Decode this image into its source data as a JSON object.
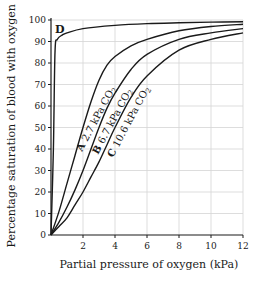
{
  "chart_data": {
    "type": "line",
    "title": "",
    "xlabel": "Partial pressure of oxygen (kPa)",
    "ylabel": "Percentage saturation of blood with oxygen",
    "xlim": [
      0,
      12
    ],
    "ylim": [
      0,
      100
    ],
    "x_ticks": [
      2,
      4,
      6,
      8,
      10,
      12
    ],
    "x_tick_labels": [
      "2",
      "4",
      "6",
      "8",
      "10",
      "12"
    ],
    "y_ticks": [
      0,
      10,
      20,
      30,
      40,
      50,
      60,
      70,
      80,
      90,
      100
    ],
    "y_tick_labels": [
      "0",
      "10",
      "20",
      "30",
      "40",
      "50",
      "60",
      "70",
      "80",
      "90",
      "100"
    ],
    "grid": true,
    "legend": "none (inline curve labels)",
    "series": [
      {
        "name": "D",
        "label": "D",
        "x": [
          0,
          0.15,
          0.25,
          0.4,
          0.7,
          1,
          2,
          4,
          6,
          8,
          10,
          12
        ],
        "values": [
          0,
          40,
          85,
          91,
          93,
          94,
          96,
          97.5,
          98.3,
          98.7,
          99,
          99.2
        ]
      },
      {
        "name": "A",
        "label": "A 2.7 kPa CO2",
        "co2_kpa": 2.7,
        "x": [
          0,
          0.5,
          1,
          1.5,
          2,
          2.5,
          3,
          3.5,
          4,
          5,
          6,
          8,
          10,
          12
        ],
        "values": [
          0,
          11,
          24,
          37,
          50,
          62,
          72,
          79,
          83,
          88,
          91,
          95,
          97,
          98
        ]
      },
      {
        "name": "B",
        "label": "B 6.7 kPa CO2",
        "co2_kpa": 6.7,
        "x": [
          0,
          0.5,
          1,
          1.5,
          2,
          2.5,
          3,
          3.5,
          4,
          5,
          6,
          8,
          10,
          12
        ],
        "values": [
          0,
          6,
          13,
          21,
          30,
          40,
          50,
          59,
          66,
          77,
          84,
          91,
          94,
          96
        ]
      },
      {
        "name": "C",
        "label": "C 10.6 kPa CO2",
        "co2_kpa": 10.6,
        "x": [
          0,
          0.5,
          1,
          1.5,
          2,
          2.5,
          3,
          3.5,
          4,
          5,
          6,
          8,
          10,
          12
        ],
        "values": [
          0,
          4,
          8,
          14,
          20,
          27,
          34,
          42,
          50,
          64,
          74,
          86,
          91,
          94
        ]
      }
    ],
    "annotations": [
      {
        "text": "D",
        "near_series": "D"
      },
      {
        "text": "A",
        "bold": true,
        "near_series": "A"
      },
      {
        "text": "2.7 kPa CO2",
        "near_series": "A"
      },
      {
        "text": "B",
        "bold": true,
        "near_series": "B"
      },
      {
        "text": "6.7 kPa CO2",
        "near_series": "B"
      },
      {
        "text": "C",
        "bold": true,
        "near_series": "C"
      },
      {
        "text": "10.6 kPa CO2",
        "near_series": "C"
      }
    ]
  },
  "labels": {
    "xlabel": "Partial pressure of oxygen (kPa)",
    "ylabel": "Percentage saturation of blood with oxygen",
    "curve_d": "D",
    "curve_a_letter": "A",
    "curve_a_text": "2.7 kPa CO",
    "curve_b_letter": "B",
    "curve_b_text": "6.7 kPa CO",
    "curve_c_letter": "C",
    "curve_c_text": "10.6 kPa CO",
    "subscript": "2"
  },
  "colors": {
    "curve": "#1a1a1a",
    "axis": "#1a1a1a",
    "grid": "#d4d4d4",
    "text": "#1a1a1a"
  }
}
